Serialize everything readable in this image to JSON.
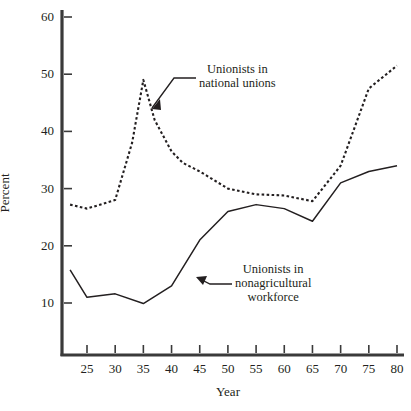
{
  "chart_data": {
    "type": "line",
    "title": "",
    "xlabel": "Year",
    "ylabel": "Percent",
    "xlim": [
      22,
      80
    ],
    "ylim": [
      5,
      62
    ],
    "grid": false,
    "legend_position": "inline-annotations",
    "x_ticks": [
      "25",
      "30",
      "35",
      "40",
      "45",
      "50",
      "55",
      "60",
      "65",
      "70",
      "75",
      "80"
    ],
    "x_tick_values": [
      25,
      30,
      35,
      40,
      45,
      50,
      55,
      60,
      65,
      70,
      75,
      80
    ],
    "y_ticks": [
      "10",
      "20",
      "30",
      "40",
      "50",
      "60"
    ],
    "y_tick_values": [
      10,
      20,
      30,
      40,
      50,
      60
    ],
    "series": [
      {
        "name": "Unionists in national unions",
        "style": "dashed",
        "color": "#231f20",
        "x": [
          22,
          25,
          30,
          33,
          35,
          37,
          40,
          42,
          45,
          50,
          55,
          60,
          65,
          70,
          75,
          80
        ],
        "values": [
          27.2,
          26.5,
          28.0,
          38.0,
          49.0,
          42.0,
          36.5,
          34.5,
          33.0,
          30.0,
          29.0,
          28.8,
          27.8,
          34.0,
          47.5,
          51.5
        ]
      },
      {
        "name": "Unionists in nonagricultural workforce",
        "style": "solid",
        "color": "#231f20",
        "x": [
          22,
          25,
          30,
          35,
          40,
          45,
          50,
          55,
          60,
          65,
          70,
          75,
          80
        ],
        "values": [
          15.8,
          11.0,
          11.6,
          9.9,
          13.0,
          21.0,
          26.0,
          27.2,
          26.5,
          24.3,
          31.0,
          33.0,
          34.0
        ]
      }
    ],
    "annotations": [
      {
        "id": "national-unions",
        "text": "Unionists in\nnational unions",
        "points_to_series": "Unionists in national unions"
      },
      {
        "id": "nonagricultural-workforce",
        "text": "Unionists in\nnonagricultural\nworkforce",
        "points_to_series": "Unionists in nonagricultural workforce"
      }
    ]
  }
}
